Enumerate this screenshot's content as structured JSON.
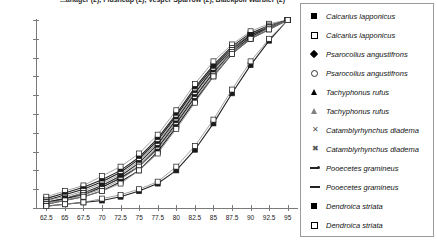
{
  "title": "...anager (2), Flushcap (2), Vesper Sparrow (2), Blackpoll Warbler (2)",
  "chart_data": {
    "type": "line",
    "title": "...anager (2), Flushcap (2), Vesper Sparrow (2), Blackpoll Warbler (2)",
    "xlabel": "",
    "ylabel": "",
    "xlim": [
      61.25,
      96.25
    ],
    "ylim": [
      0,
      100
    ],
    "grid": false,
    "legend_position": "right",
    "y_ticks": [
      "0%",
      "10%",
      "20%",
      "30%",
      "40%",
      "50%",
      "60%",
      "70%",
      "80%",
      "90%",
      "100%"
    ],
    "y_tick_values": [
      0,
      10,
      20,
      30,
      40,
      50,
      60,
      70,
      80,
      90,
      100
    ],
    "x_ticks": [
      "62.5",
      "65",
      "67.5",
      "70",
      "72.5",
      "75",
      "77.5",
      "80",
      "82.5",
      "85",
      "87.5",
      "90",
      "92.5",
      "95"
    ],
    "x_tick_values": [
      62.5,
      65,
      67.5,
      70,
      72.5,
      75,
      77.5,
      80,
      82.5,
      85,
      87.5,
      90,
      92.5,
      95
    ],
    "x": [
      62.5,
      65,
      67.5,
      70,
      72.5,
      75,
      77.5,
      80,
      82.5,
      85,
      87.5,
      90,
      92.5,
      95
    ],
    "series": [
      {
        "name": "Calcarius lapponicus",
        "marker": "filled-square",
        "values": [
          5,
          8,
          11,
          15,
          20,
          27,
          37,
          50,
          64,
          76,
          86,
          93,
          97,
          100
        ]
      },
      {
        "name": "Calcarius lapponicus",
        "marker": "open-square",
        "values": [
          6,
          9,
          12,
          17,
          22,
          29,
          39,
          52,
          66,
          78,
          87,
          94,
          98,
          100
        ]
      },
      {
        "name": "Psarocolius angustifrons",
        "marker": "filled-diamond",
        "values": [
          4,
          7,
          10,
          14,
          19,
          26,
          36,
          49,
          63,
          75,
          85,
          92,
          97,
          100
        ]
      },
      {
        "name": "Psarocolius angustifrons",
        "marker": "open-circle",
        "values": [
          4,
          6,
          9,
          13,
          18,
          25,
          35,
          48,
          62,
          74,
          85,
          92,
          97,
          100
        ]
      },
      {
        "name": "Tachyphonus rufus",
        "marker": "filled-triangle",
        "values": [
          3,
          5,
          8,
          12,
          17,
          24,
          34,
          47,
          61,
          74,
          84,
          92,
          96,
          100
        ]
      },
      {
        "name": "Tachyphonus rufus",
        "marker": "open-triangle",
        "values": [
          3,
          5,
          8,
          11,
          16,
          23,
          33,
          46,
          60,
          73,
          84,
          91,
          96,
          100
        ]
      },
      {
        "name": "Catamblyrhynchus diadema",
        "marker": "x-mark",
        "values": [
          3,
          5,
          7,
          11,
          16,
          22,
          32,
          45,
          59,
          72,
          83,
          91,
          96,
          100
        ]
      },
      {
        "name": "Catamblyrhynchus diadema",
        "marker": "x-star",
        "values": [
          3,
          4,
          7,
          10,
          15,
          22,
          31,
          44,
          58,
          71,
          83,
          90,
          96,
          100
        ]
      },
      {
        "name": "Pooecetes gramineus",
        "marker": "dash-dot",
        "values": [
          2,
          4,
          6,
          9,
          14,
          20,
          30,
          43,
          57,
          70,
          82,
          90,
          95,
          100
        ]
      },
      {
        "name": "Pooecetes gramineus",
        "marker": "dash",
        "values": [
          2,
          4,
          6,
          9,
          13,
          20,
          29,
          42,
          56,
          70,
          82,
          90,
          95,
          100
        ]
      },
      {
        "name": "Dendroica striata",
        "marker": "filled-square",
        "values": [
          1,
          2,
          3,
          4,
          6,
          9,
          13,
          20,
          31,
          45,
          61,
          76,
          89,
          100
        ]
      },
      {
        "name": "Dendroica striata",
        "marker": "open-square",
        "values": [
          1,
          2,
          3,
          5,
          7,
          10,
          14,
          22,
          33,
          47,
          63,
          78,
          90,
          100
        ]
      }
    ]
  },
  "legend": {
    "items": [
      {
        "label": "Calcarius lapponicus",
        "marker": "filled-square"
      },
      {
        "label": "Calcarius lapponicus",
        "marker": "open-square"
      },
      {
        "label": "Psarocolius angustifrons",
        "marker": "filled-diamond"
      },
      {
        "label": "Psarocolius angustifrons",
        "marker": "open-circle"
      },
      {
        "label": "Tachyphonus rufus",
        "marker": "filled-triangle"
      },
      {
        "label": "Tachyphonus rufus",
        "marker": "open-triangle"
      },
      {
        "label": "Catamblyrhynchus diadema",
        "marker": "x-mark"
      },
      {
        "label": "Catamblyrhynchus diadema",
        "marker": "x-star"
      },
      {
        "label": "Pooecetes gramineus",
        "marker": "dash-dot"
      },
      {
        "label": "Pooecetes gramineus",
        "marker": "dash"
      },
      {
        "label": "Dendroica striata",
        "marker": "filled-square"
      },
      {
        "label": "Dendroica striata",
        "marker": "open-square"
      }
    ]
  },
  "colors": {
    "axis": "#7a7a7a",
    "line_dark": "#222222",
    "line_grey": "#8c8c8c",
    "legend_border": "#9a9a9a",
    "text": "#111111"
  }
}
